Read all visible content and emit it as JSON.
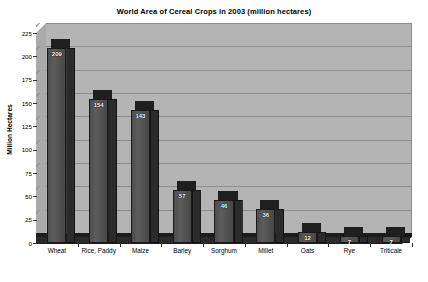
{
  "chart_data": {
    "type": "bar",
    "title": "World Area of Cereal Crops in 2003 (million hectares)",
    "xlabel": "Crop",
    "ylabel": "Million Hectares",
    "categories": [
      "Wheat",
      "Rice, Paddy",
      "Maize",
      "Barley",
      "Sorghum",
      "Millet",
      "Oats",
      "Rye",
      "Triticale"
    ],
    "values": [
      209,
      154,
      143,
      57,
      46,
      36,
      12,
      7,
      7
    ],
    "ylim": [
      0,
      225
    ],
    "yticks": [
      "0",
      "25",
      "50",
      "75",
      "100",
      "125",
      "150",
      "175",
      "200",
      "225"
    ],
    "ytick_values": [
      0,
      25,
      50,
      75,
      100,
      125,
      150,
      175,
      200,
      225
    ],
    "grid": "horizontal",
    "legend": "none",
    "style": "3d-column",
    "colors": {
      "plot_background": "#b4b4b4",
      "gridline": "#8e8e8e",
      "bar_front": "#545454",
      "bar_side": "#2b2b2b",
      "bar_top": "#1f1f1f",
      "data_label": "#ffffff",
      "text": "#000000",
      "page_background": "#ffffff"
    }
  }
}
